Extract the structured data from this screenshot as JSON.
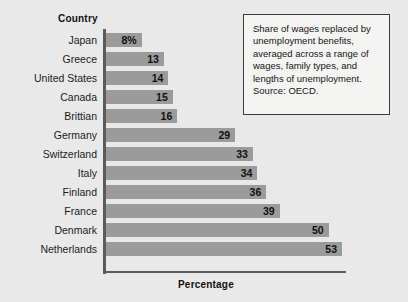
{
  "chart_data": {
    "type": "bar",
    "orientation": "horizontal",
    "title": "",
    "xlabel": "Percentage",
    "ylabel": "Country",
    "categories": [
      "Japan",
      "Greece",
      "United States",
      "Canada",
      "Brittian",
      "Germany",
      "Switzerland",
      "Italy",
      "Finland",
      "France",
      "Denmark",
      "Netherlands"
    ],
    "values": [
      8,
      13,
      14,
      15,
      16,
      29,
      33,
      34,
      36,
      39,
      50,
      53
    ],
    "value_labels": [
      "8%",
      "13",
      "14",
      "15",
      "16",
      "29",
      "33",
      "34",
      "36",
      "39",
      "50",
      "53"
    ],
    "xlim": [
      0,
      53
    ],
    "grid": false,
    "legend": null,
    "bar_color": "#9b9b9b",
    "axis_color": "#5b5b5b",
    "background_color": "#e9e9e9"
  },
  "axes": {
    "category_header": "Country",
    "value_axis_label": "Percentage"
  },
  "caption": {
    "text": "Share of wages replaced by unemployment benefits, averaged across a range of wages, family types, and lengths of unemployment. Source: OECD."
  }
}
